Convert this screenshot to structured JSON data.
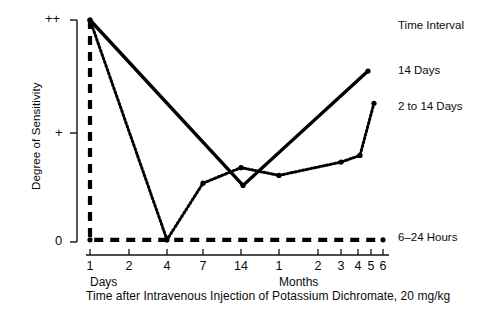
{
  "chart_data": {
    "type": "line",
    "title": "",
    "xlabel": "Time after Intravenous Injection of Potassium Dichromate, 20 mg/kg",
    "ylabel": "Degree of Sensitivity",
    "y_ticks": [
      "0",
      "+",
      "++"
    ],
    "y_values": [
      0,
      1,
      2
    ],
    "ylim": [
      0,
      2
    ],
    "grid": false,
    "legend_position": "right",
    "legend_title": "Time Interval",
    "x_axis": {
      "segments": [
        {
          "unit_label": "Days",
          "ticks": [
            "1",
            "2",
            "4",
            "7",
            "14"
          ]
        },
        {
          "unit_label": "Months",
          "ticks": [
            "1",
            "2",
            "3",
            "4",
            "5",
            "6"
          ]
        }
      ],
      "tick_labels": [
        "1",
        "2",
        "4",
        "7",
        "14",
        "1",
        "2",
        "3",
        "4",
        "5",
        "6"
      ],
      "tick_x_px": [
        90,
        129,
        167,
        203,
        241,
        279,
        318,
        341,
        358,
        371,
        383
      ]
    },
    "series": [
      {
        "name": "14 Days",
        "style": "solid",
        "color": "#000000",
        "points": [
          {
            "x_px": 90,
            "y_value": 2.0
          },
          {
            "x_px": 243,
            "y_value": 0.51
          },
          {
            "x_px": 368,
            "y_value": 1.54
          }
        ]
      },
      {
        "name": "2 to 14 Days",
        "style": "dotted",
        "color": "#000000",
        "points": [
          {
            "x_px": 90,
            "y_value": 2.0
          },
          {
            "x_px": 167,
            "y_value": 0.02
          },
          {
            "x_px": 203,
            "y_value": 0.53
          },
          {
            "x_px": 241,
            "y_value": 0.67
          },
          {
            "x_px": 279,
            "y_value": 0.6
          },
          {
            "x_px": 341,
            "y_value": 0.72
          },
          {
            "x_px": 360,
            "y_value": 0.78
          },
          {
            "x_px": 374,
            "y_value": 1.25
          }
        ]
      },
      {
        "name": "6–24 Hours",
        "style": "dashed",
        "color": "#000000",
        "points": [
          {
            "x_px": 90,
            "y_value": 2.0
          },
          {
            "x_px": 90,
            "y_value": 0.02
          },
          {
            "x_px": 383,
            "y_value": 0.02
          }
        ]
      }
    ]
  },
  "legend": {
    "title": "Time Interval",
    "items": [
      {
        "label": "14 Days",
        "style": "solid"
      },
      {
        "label": "2 to 14 Days",
        "style": "dotted"
      },
      {
        "label": "6–24 Hours",
        "style": "dashed"
      }
    ]
  },
  "axes": {
    "y_label": "Degree of Sensitivity",
    "y_tick_top": "++",
    "y_tick_mid": "+",
    "y_tick_bottom": "0",
    "x_unit_days": "Days",
    "x_unit_months": "Months",
    "x_ticks_days": [
      "1",
      "2",
      "4",
      "7",
      "14"
    ],
    "x_ticks_months": [
      "1",
      "2",
      "3",
      "4",
      "5",
      "6"
    ]
  },
  "caption": "Time after Intravenous Injection of Potassium Dichromate, 20 mg/kg"
}
